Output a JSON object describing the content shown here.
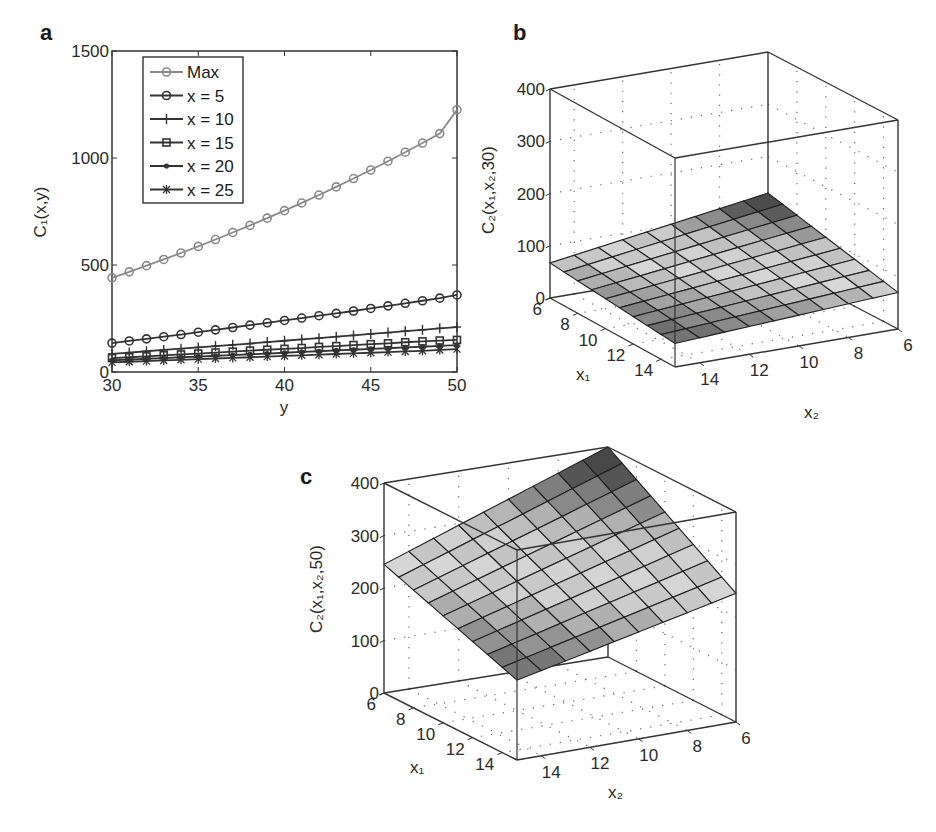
{
  "chart_data": [
    {
      "panel": "a",
      "type": "line",
      "title": "",
      "xlabel": "y",
      "ylabel": "C1(x,y)",
      "xlim": [
        30,
        50
      ],
      "ylim": [
        0,
        1500
      ],
      "xticks": [
        30,
        35,
        40,
        45,
        50
      ],
      "yticks": [
        0,
        500,
        1000,
        1500
      ],
      "grid": false,
      "legend_position": "upper-left",
      "x": [
        30,
        31,
        32,
        33,
        34,
        35,
        36,
        37,
        38,
        39,
        40,
        41,
        42,
        43,
        44,
        45,
        46,
        47,
        48,
        49,
        50
      ],
      "series": [
        {
          "name": "Max",
          "marker": "circle",
          "color": "#8a8a8a",
          "values": [
            440,
            468,
            497,
            526,
            556,
            587,
            619,
            652,
            685,
            719,
            754,
            790,
            827,
            865,
            904,
            944,
            985,
            1027,
            1070,
            1114,
            1225
          ]
        },
        {
          "name": "x = 5",
          "marker": "circle",
          "color": "#333333",
          "values": [
            135,
            145,
            155,
            165,
            175,
            186,
            197,
            208,
            219,
            230,
            241,
            252,
            263,
            274,
            285,
            297,
            309,
            321,
            333,
            345,
            360
          ]
        },
        {
          "name": "x = 10",
          "marker": "plus",
          "color": "#333333",
          "values": [
            85,
            91,
            97,
            103,
            109,
            115,
            121,
            127,
            133,
            140,
            146,
            152,
            158,
            165,
            171,
            178,
            184,
            191,
            197,
            204,
            210
          ]
        },
        {
          "name": "x = 15",
          "marker": "square",
          "color": "#333333",
          "values": [
            65,
            69,
            73,
            78,
            82,
            86,
            91,
            95,
            100,
            104,
            108,
            112,
            117,
            121,
            126,
            130,
            134,
            139,
            143,
            147,
            150
          ]
        },
        {
          "name": "x = 20",
          "marker": "dot",
          "color": "#333333",
          "values": [
            55,
            58,
            62,
            65,
            69,
            72,
            76,
            79,
            83,
            86,
            90,
            94,
            97,
            101,
            104,
            108,
            111,
            115,
            118,
            122,
            126
          ]
        },
        {
          "name": "x = 25",
          "marker": "star",
          "color": "#333333",
          "values": [
            45,
            48,
            51,
            54,
            57,
            60,
            63,
            66,
            69,
            72,
            75,
            78,
            81,
            84,
            87,
            90,
            93,
            96,
            99,
            103,
            107
          ]
        }
      ]
    },
    {
      "panel": "b",
      "type": "surface",
      "title": "",
      "xlabel": "x1",
      "ylabel": "x2",
      "zlabel": "C2(x1,x2,30)",
      "xlim": [
        6,
        15
      ],
      "ylim": [
        6,
        15
      ],
      "zlim": [
        0,
        400
      ],
      "xticks": [
        6,
        8,
        10,
        12,
        14
      ],
      "yticks": [
        6,
        8,
        10,
        12,
        14
      ],
      "zticks": [
        0,
        100,
        200,
        300,
        400
      ],
      "grid": true,
      "corner_values": {
        "x1_6_x2_15": 67,
        "x1_6_x2_6": 130,
        "x1_15_x2_6": 70,
        "x1_15_x2_15": 45
      }
    },
    {
      "panel": "c",
      "type": "surface",
      "title": "",
      "xlabel": "x1",
      "ylabel": "x2",
      "zlabel": "C2(x1,x2,50)",
      "xlim": [
        6,
        15
      ],
      "ylim": [
        6,
        15
      ],
      "zlim": [
        0,
        400
      ],
      "xticks": [
        6,
        8,
        10,
        12,
        14
      ],
      "yticks": [
        6,
        8,
        10,
        12,
        14
      ],
      "zticks": [
        0,
        100,
        200,
        300,
        400
      ],
      "grid": true,
      "corner_values": {
        "x1_6_x2_15": 245,
        "x1_6_x2_6": 400,
        "x1_15_x2_6": 245,
        "x1_15_x2_15": 152
      }
    }
  ],
  "labels": {
    "panel_a": "a",
    "panel_b": "b",
    "panel_c": "c",
    "a_xlabel": "y",
    "a_ylabel": "C₁(x,y)",
    "b_zlabel": "C₂(x₁,x₂,30)",
    "c_zlabel": "C₂(x₁,x₂,50)",
    "x1_label": "x₁",
    "x2_label": "x₂"
  }
}
